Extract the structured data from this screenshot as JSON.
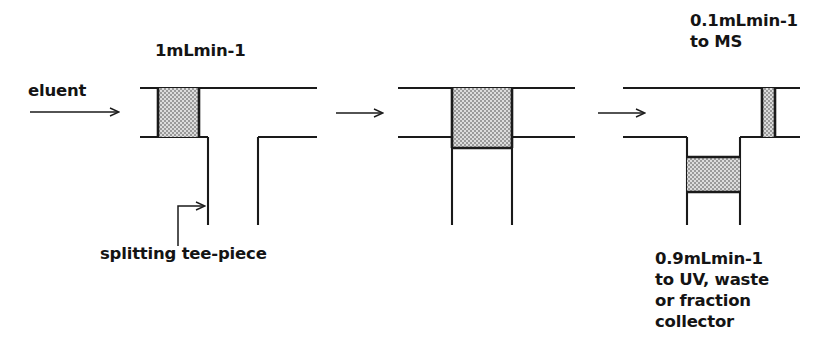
{
  "figure": {
    "type": "process-flow-diagram",
    "stroke_color": "#1a1a1a",
    "hatch_fill_color": "#d8d8d8",
    "background_color": "#ffffff"
  },
  "labels": {
    "eluent": "eluent",
    "flow_in": "1mLmin-1",
    "tee_piece": "splitting tee-piece",
    "to_ms": "0.1mLmin-1\nto MS",
    "to_uv": "0.9mLmin-1\nto UV, waste\nor fraction\ncollector"
  },
  "flows": {
    "inlet_rate": "1mLmin-1",
    "ms_rate": "0.1mLmin-1",
    "waste_rate": "0.9mLmin-1",
    "ms_destination": "to MS",
    "waste_destination": "to UV, waste or fraction collector"
  },
  "panels": [
    {
      "name": "panel-1",
      "caption": "1mLmin-1",
      "band_orientation": "vertical",
      "band_position": "inlet"
    },
    {
      "name": "panel-2",
      "caption": "",
      "band_orientation": "block",
      "band_position": "junction"
    },
    {
      "name": "panel-3",
      "caption": "0.1mLmin-1 to MS / 0.9mLmin-1 to UV, waste or fraction collector",
      "band_orientation": "split",
      "band_position": "outlets"
    }
  ],
  "arrows": {
    "eluent_arrow": "eluent-flow-arrow",
    "step_arrow_1": "step-arrow",
    "step_arrow_2": "step-arrow",
    "tee_pointer": "tee-piece-leader-arrow"
  }
}
